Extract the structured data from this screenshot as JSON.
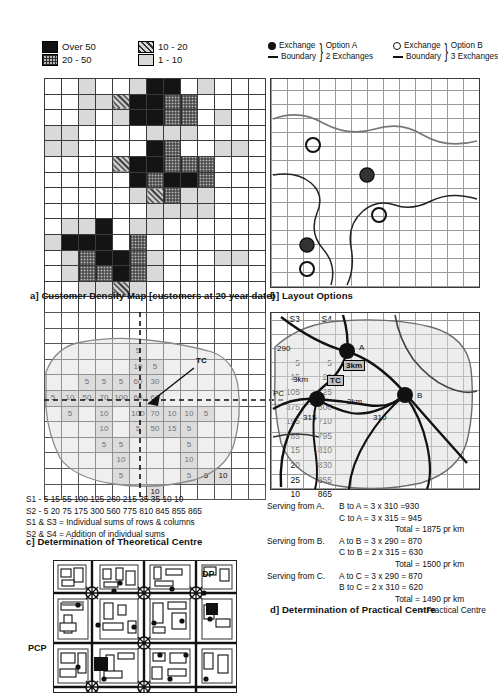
{
  "figure": {
    "panel_a": {
      "caption": "a] Customer Density Map [customers at 20 year date]",
      "legend": [
        {
          "label": "Over 50",
          "pattern": "solid-black"
        },
        {
          "label": "10 - 20",
          "pattern": "diagonal-hatch"
        },
        {
          "label": "20 - 50",
          "pattern": "cross-hatch"
        },
        {
          "label": "1 - 10",
          "pattern": "light-grey"
        }
      ],
      "grid_cols": 13,
      "grid_rows": 15,
      "density_codes": [
        [
          0,
          0,
          1,
          0,
          0,
          1,
          4,
          4,
          0,
          1,
          0,
          0,
          0
        ],
        [
          0,
          0,
          1,
          1,
          2,
          4,
          4,
          3,
          3,
          0,
          0,
          0,
          0
        ],
        [
          0,
          0,
          1,
          0,
          1,
          4,
          4,
          3,
          3,
          0,
          1,
          0,
          0
        ],
        [
          1,
          1,
          0,
          0,
          0,
          0,
          1,
          1,
          1,
          0,
          0,
          0,
          0
        ],
        [
          1,
          1,
          0,
          0,
          0,
          0,
          4,
          3,
          0,
          0,
          1,
          1,
          0
        ],
        [
          0,
          0,
          0,
          0,
          2,
          4,
          4,
          3,
          3,
          3,
          0,
          0,
          0
        ],
        [
          0,
          0,
          0,
          0,
          0,
          4,
          3,
          4,
          4,
          3,
          0,
          0,
          0
        ],
        [
          0,
          0,
          0,
          0,
          0,
          1,
          2,
          3,
          1,
          1,
          0,
          0,
          0
        ],
        [
          0,
          0,
          0,
          0,
          0,
          0,
          1,
          1,
          1,
          1,
          0,
          0,
          0
        ],
        [
          0,
          1,
          1,
          4,
          0,
          1,
          1,
          0,
          0,
          0,
          0,
          0,
          0
        ],
        [
          1,
          4,
          4,
          4,
          0,
          3,
          0,
          0,
          0,
          0,
          0,
          0,
          0
        ],
        [
          0,
          1,
          3,
          4,
          4,
          3,
          1,
          0,
          0,
          0,
          1,
          1,
          0
        ],
        [
          0,
          1,
          3,
          3,
          4,
          3,
          1,
          0,
          0,
          0,
          0,
          0,
          0
        ],
        [
          0,
          0,
          1,
          1,
          2,
          1,
          0,
          0,
          0,
          0,
          0,
          0,
          0
        ],
        [
          0,
          0,
          0,
          0,
          0,
          0,
          0,
          0,
          0,
          0,
          0,
          0,
          0
        ]
      ]
    },
    "panel_b": {
      "caption": "b] Layout Options",
      "legend": [
        {
          "symbol": "filled-circle",
          "label": "Exchange",
          "option": "Option A",
          "detail": "2 Exchanges"
        },
        {
          "symbol": "line",
          "label": "Boundary",
          "option": "Option A",
          "detail": "2 Exchanges"
        },
        {
          "symbol": "open-circle",
          "label": "Exchange",
          "option": "Option B",
          "detail": "3 Exchanges"
        },
        {
          "symbol": "line",
          "label": "Boundary",
          "option": "Option B",
          "detail": "3 Exchanges"
        }
      ],
      "option_a_label": "Option A",
      "option_a_detail": "2 Exchanges",
      "option_b_label": "Option B",
      "option_b_detail": "3 Exchanges",
      "exchange_filled": "Exchange",
      "exchange_open": "Exchange",
      "boundary": "Boundary"
    },
    "panel_c": {
      "caption": "c] Determination of Theoretical Centre",
      "marker": "TC",
      "col_headers": [
        "S3",
        "S4"
      ],
      "cells": [
        [
          "",
          "",
          "",
          "",
          "",
          "",
          "",
          "",
          "",
          "",
          "",
          "",
          ""
        ],
        [
          "",
          "",
          "",
          "",
          "",
          "",
          "",
          "",
          "",
          "",
          "",
          "",
          ""
        ],
        [
          "",
          "",
          "",
          "",
          "",
          "5",
          "",
          "",
          "",
          "",
          "",
          "",
          ""
        ],
        [
          "",
          "",
          "",
          "",
          "",
          "10",
          "5",
          "",
          "",
          "",
          "",
          "",
          ""
        ],
        [
          "",
          "",
          "5",
          "5",
          "5",
          "60",
          "30",
          "",
          "",
          "",
          "",
          "",
          ""
        ],
        [
          "5",
          "10",
          "50",
          "70",
          "100",
          "60",
          "60",
          "",
          "",
          "",
          "",
          "",
          ""
        ],
        [
          "",
          "5",
          "",
          "10",
          "",
          "100",
          "70",
          "10",
          "10",
          "5",
          "",
          "",
          ""
        ],
        [
          "",
          "",
          "",
          "10",
          "",
          "5",
          "50",
          "15",
          "5",
          "",
          "",
          "",
          ""
        ],
        [
          "",
          "",
          "",
          "5",
          "5",
          "",
          "",
          "",
          "5",
          "",
          "",
          "",
          ""
        ],
        [
          "",
          "",
          "",
          "",
          "10",
          "",
          "",
          "",
          "10",
          "",
          "",
          "",
          ""
        ],
        [
          "",
          "",
          "",
          "",
          "5",
          "",
          "",
          "",
          "5",
          "5",
          "10",
          "",
          ""
        ],
        [
          "",
          "",
          "",
          "",
          "",
          "",
          "10",
          "",
          "",
          "",
          "",
          "",
          ""
        ]
      ],
      "s3": [
        "",
        "",
        "5",
        "15",
        "105",
        "375",
        "195",
        "85",
        "15",
        "20",
        "25",
        "10"
      ],
      "s4": [
        "",
        "",
        "5",
        "20",
        "125",
        "500",
        "710",
        "795",
        "810",
        "830",
        "855",
        "865"
      ],
      "s1_label": "S1 - 5 15  55  100 125 260 215 35 35 10  10",
      "s2_label": "S2 - 5  20 75 175 300 560 775 810 845 855 865",
      "note1": "S1 & S3 = Individual sums of rows & columns",
      "note2": "S2 & S4 = Addition of individual sums"
    },
    "panel_d": {
      "caption": "d]  Determination of Practical Centre",
      "map_labels": [
        {
          "text": "290",
          "kind": "distance"
        },
        {
          "text": "A",
          "kind": "node"
        },
        {
          "text": "3km",
          "kind": "distance"
        },
        {
          "text": "3km",
          "kind": "distance"
        },
        {
          "text": "TC",
          "kind": "theoretical-centre"
        },
        {
          "text": "PC",
          "kind": "practical-centre"
        },
        {
          "text": "C",
          "kind": "node"
        },
        {
          "text": "2km",
          "kind": "distance"
        },
        {
          "text": "B",
          "kind": "node"
        },
        {
          "text": "315",
          "kind": "distance"
        },
        {
          "text": "310",
          "kind": "distance"
        }
      ],
      "calculations": [
        {
          "from": "Serving from A.",
          "line1": "B to A = 3 x 310 =930",
          "line2": "C to A = 3 x 315 = 945",
          "total": "Total = 1875 pr km"
        },
        {
          "from": "Serving from B.",
          "line1": "A to B = 3 x 290 = 870",
          "line2": "C to B = 2 x 315 = 630",
          "total": "Total = 1500 pr km"
        },
        {
          "from": "Serving from C.",
          "line1": "A to C = 3 x 290 = 870",
          "line2": "B to C = 2 x 310 = 620",
          "total": "Total = 1490 pr km"
        }
      ],
      "conclusion": "= Practical Centre"
    },
    "panel_e": {
      "labels": [
        {
          "text": "DP",
          "role": "distribution-point"
        },
        {
          "text": "PCP",
          "role": "primary-connection-point"
        }
      ]
    }
  }
}
